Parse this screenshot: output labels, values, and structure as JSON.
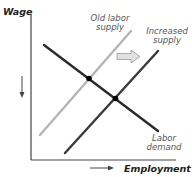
{
  "diagram": {
    "type": "supply-demand",
    "y_axis_label": "Wage",
    "x_axis_label": "Employment",
    "curves": [
      {
        "name": "Old labor supply",
        "label_line1": "Old labor",
        "label_line2": "supply",
        "color": "#b0b0b0"
      },
      {
        "name": "Increased supply",
        "label_line1": "Increased",
        "label_line2": "supply",
        "color": "#333333"
      },
      {
        "name": "Labor demand",
        "label_line1": "Labor",
        "label_line2": "demand",
        "color": "#2a2a2a"
      }
    ],
    "shift_arrow": "right",
    "wage_arrow": "down",
    "employment_arrow": "right",
    "equilibria": [
      "old-equilibrium",
      "new-equilibrium"
    ]
  }
}
